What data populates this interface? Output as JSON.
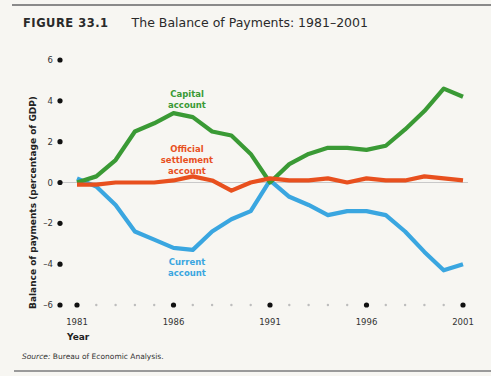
{
  "figure": {
    "label": "FIGURE 33.1",
    "title": "The Balance of Payments: 1981–2001",
    "source_prefix": "Source:",
    "source_text": " Bureau of Economic Analysis."
  },
  "chart_data": {
    "type": "line",
    "title": "The Balance of Payments: 1981–2001",
    "xlabel": "Year",
    "ylabel": "Balance of payments (percentage of GDP)",
    "xlim": [
      1981,
      2001
    ],
    "ylim": [
      -6,
      6
    ],
    "x_ticks": [
      1981,
      1986,
      1991,
      1996,
      2001
    ],
    "x_tick_labels": [
      "1981",
      "1986",
      "1991",
      "1996",
      "2001"
    ],
    "y_ticks": [
      6,
      4,
      2,
      0,
      -2,
      -4,
      -6
    ],
    "y_tick_labels": [
      "6",
      "4",
      "2",
      "0",
      "–2",
      "–4",
      "–6"
    ],
    "grid": false,
    "zero_line": true,
    "legend": "inline-labels",
    "x": [
      1981,
      1982,
      1983,
      1984,
      1985,
      1986,
      1987,
      1988,
      1989,
      1990,
      1991,
      1992,
      1993,
      1994,
      1995,
      1996,
      1997,
      1998,
      1999,
      2000,
      2001
    ],
    "series": [
      {
        "name": "Capital account",
        "label_lines": [
          "Capital",
          "account"
        ],
        "color": "#3a9a35",
        "values": [
          0.0,
          0.3,
          1.1,
          2.5,
          2.9,
          3.4,
          3.2,
          2.5,
          2.3,
          1.4,
          0.0,
          0.9,
          1.4,
          1.7,
          1.7,
          1.6,
          1.8,
          2.6,
          3.5,
          4.6,
          4.2
        ]
      },
      {
        "name": "Official settlement account",
        "label_lines": [
          "Official",
          "settlement",
          "account"
        ],
        "color": "#e8501e",
        "values": [
          -0.1,
          -0.1,
          0.0,
          0.0,
          0.0,
          0.1,
          0.3,
          0.1,
          -0.4,
          0.0,
          0.2,
          0.1,
          0.1,
          0.2,
          0.0,
          0.2,
          0.1,
          0.1,
          0.3,
          0.2,
          0.1
        ]
      },
      {
        "name": "Current account",
        "label_lines": [
          "Current",
          "account"
        ],
        "color": "#3aa6e0",
        "values": [
          0.2,
          -0.2,
          -1.1,
          -2.4,
          -2.8,
          -3.2,
          -3.3,
          -2.4,
          -1.8,
          -1.4,
          0.1,
          -0.7,
          -1.1,
          -1.6,
          -1.4,
          -1.4,
          -1.6,
          -2.4,
          -3.4,
          -4.3,
          -4.0
        ]
      }
    ]
  }
}
